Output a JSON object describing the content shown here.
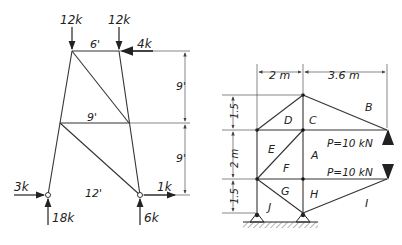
{
  "left_truss": {
    "loads": {
      "top_left": "12k",
      "top_right": "12k",
      "horizontal_top": "4k",
      "left_support_horizontal": "3k",
      "left_support_vertical": "18k",
      "right_support_horizontal": "1k",
      "right_support_vertical": "6k"
    },
    "dimensions": {
      "top_width": "6'",
      "mid_width": "9'",
      "bottom_width": "12'",
      "upper_height": "9'",
      "lower_height": "9'"
    }
  },
  "right_truss": {
    "dimensions": {
      "left_width": "2 m",
      "right_width": "3.6 m",
      "top_height": "1.5",
      "mid_height": "2 m",
      "bottom_height": "1.5"
    },
    "regions": [
      "A",
      "B",
      "C",
      "D",
      "E",
      "F",
      "G",
      "H",
      "I",
      "J"
    ],
    "loads": {
      "upper": "P=10 kN",
      "lower": "P=10 kN"
    }
  }
}
